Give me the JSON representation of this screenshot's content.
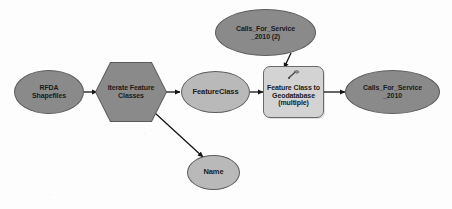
{
  "diagram": {
    "background_color": "#fdfdfd",
    "nodes": {
      "input_shapefiles": {
        "label": "RFDA\nShapefiles",
        "shape": "ellipse",
        "role": "project-data-variable",
        "fill": "#8a8a8a",
        "stroke": "#5d5d5d"
      },
      "iterator": {
        "label": "Iterate Feature\nClasses",
        "shape": "hexagon",
        "role": "iterator",
        "fill": "#8a8a8a",
        "stroke": "#5a5a5a"
      },
      "feature_class_var": {
        "label": "FeatureClass",
        "shape": "ellipse",
        "role": "derived-variable",
        "fill": "#b9b9b9",
        "stroke": "#5d5d5d"
      },
      "name_var": {
        "label": "Name",
        "shape": "ellipse",
        "role": "derived-variable",
        "fill": "#b9b9b9",
        "stroke": "#5d5d5d"
      },
      "output_gdb": {
        "label": "Calls_For_Service\n_2010 (2)",
        "shape": "ellipse",
        "role": "project-data-variable",
        "fill": "#8a8a8a",
        "stroke": "#5d5d5d"
      },
      "tool": {
        "label": "Feature Class to\nGeodatabase\n(multiple)",
        "shape": "rounded-rectangle",
        "role": "geoprocessing-tool",
        "fill": "#d3d3d3",
        "stroke": "#6a6a6a",
        "icon": "hammer-tool-icon"
      },
      "result_output": {
        "label": "Calls_For_Service\n_2010",
        "shape": "ellipse",
        "role": "derived-output-variable",
        "fill": "#8a8a8a",
        "stroke": "#5d5d5d"
      }
    },
    "connectors": [
      {
        "name": "shapefiles-to-iterator",
        "from": "input_shapefiles",
        "to": "iterator"
      },
      {
        "name": "iterator-to-featureclass",
        "from": "iterator",
        "to": "feature_class_var"
      },
      {
        "name": "iterator-to-name",
        "from": "iterator",
        "to": "name_var"
      },
      {
        "name": "featureclass-to-tool",
        "from": "feature_class_var",
        "to": "tool"
      },
      {
        "name": "gdb-to-tool",
        "from": "output_gdb",
        "to": "tool"
      },
      {
        "name": "tool-to-result",
        "from": "tool",
        "to": "result_output"
      }
    ]
  }
}
